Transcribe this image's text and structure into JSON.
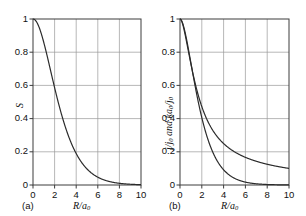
{
  "figure": {
    "background": "#ffffff",
    "grid_color": "#9a9a9a",
    "axis_color": "#3c3c3c",
    "curve_color": "#2b2b2b"
  },
  "panels": [
    {
      "tag": "(a)",
      "ylabel": "S",
      "xlabel_num": "R",
      "xlabel_den": "a",
      "xlabel_den_sub": "0",
      "yticks": [
        "0",
        "0.2",
        "0.4",
        "0.6",
        "0.8",
        "1"
      ],
      "xticks": [
        "0",
        "2",
        "4",
        "6",
        "8",
        "10"
      ]
    },
    {
      "tag": "(b)",
      "ylabel_parts": [
        "j",
        "/j",
        "0",
        " and ",
        "ka",
        "0",
        "/j",
        "0"
      ],
      "xlabel_num": "R",
      "xlabel_den": "a",
      "xlabel_den_sub": "0",
      "yticks": [
        "0",
        "0.2",
        "0.4",
        "0.6",
        "0.8",
        "1"
      ],
      "xticks": [
        "0",
        "2",
        "4",
        "6",
        "8",
        "10"
      ],
      "curve_labels": [
        "j",
        "k"
      ]
    }
  ],
  "chart_data": [
    {
      "type": "line",
      "title": "",
      "panel": "(a)",
      "xlabel": "R/a0",
      "ylabel": "S",
      "xlim": [
        0,
        10
      ],
      "ylim": [
        0,
        1
      ],
      "xticks": [
        0,
        2,
        4,
        6,
        8,
        10
      ],
      "yticks": [
        0,
        0.2,
        0.4,
        0.6,
        0.8,
        1
      ],
      "grid": true,
      "legend": "none",
      "series": [
        {
          "name": "S",
          "x": [
            0,
            0.25,
            0.5,
            0.75,
            1,
            1.25,
            1.5,
            1.75,
            2,
            2.25,
            2.5,
            2.75,
            3,
            3.5,
            4,
            4.5,
            5,
            5.5,
            6,
            6.5,
            7,
            7.5,
            8,
            8.5,
            9,
            9.5,
            10
          ],
          "y": [
            1.0,
            0.9754,
            0.9131,
            0.8279,
            0.7358,
            0.6461,
            0.5249,
            0.4711,
            0.5865,
            0.3485,
            0.2791,
            0.2311,
            0.1991,
            0.132,
            0.1893,
            0.0758,
            0.0493,
            0.0316,
            0.02,
            0.0125,
            0.0078,
            0.0048,
            0.0029,
            0.0018,
            0.0011,
            0.0006,
            0.0004
          ]
        }
      ],
      "formula": "S = exp(-R/a0) * (1 + R/a0 + (R/a0)^2/3)",
      "read_points": [
        {
          "x": 0,
          "y": 1.0
        },
        {
          "x": 2,
          "y": 0.586
        },
        {
          "x": 4,
          "y": 0.189
        },
        {
          "x": 6,
          "y": 0.047
        },
        {
          "x": 8,
          "y": 0.01
        },
        {
          "x": 10,
          "y": 0.002
        }
      ]
    },
    {
      "type": "line",
      "title": "",
      "panel": "(b)",
      "xlabel": "R/a0",
      "ylabel": "j/j0 and ka0/j0",
      "xlim": [
        0,
        10
      ],
      "ylim": [
        0,
        1
      ],
      "xticks": [
        0,
        2,
        4,
        6,
        8,
        10
      ],
      "yticks": [
        0,
        0.2,
        0.4,
        0.6,
        0.8,
        1
      ],
      "grid": true,
      "legend": "inline-labels",
      "series": [
        {
          "name": "j",
          "label_position": {
            "x": 4.6,
            "y": 0.27
          },
          "formula": "j/j0 = (a0/R) * (1 - (1 + R/a0) * exp(-2R/a0))",
          "read_points": [
            {
              "x": 0,
              "y": 1.0
            },
            {
              "x": 0.5,
              "y": 0.8
            },
            {
              "x": 1,
              "y": 0.64
            },
            {
              "x": 1.5,
              "y": 0.53
            },
            {
              "x": 2,
              "y": 0.455
            },
            {
              "x": 3,
              "y": 0.332
            },
            {
              "x": 4,
              "y": 0.25
            },
            {
              "x": 5,
              "y": 0.2
            },
            {
              "x": 6,
              "y": 0.167
            },
            {
              "x": 7,
              "y": 0.143
            },
            {
              "x": 8,
              "y": 0.125
            },
            {
              "x": 9,
              "y": 0.111
            },
            {
              "x": 10,
              "y": 0.1
            }
          ]
        },
        {
          "name": "k",
          "label_position": {
            "x": 4.1,
            "y": 0.115
          },
          "formula": "ka0/j0 = (1 + R/a0) * exp(-R/a0)",
          "read_points": [
            {
              "x": 0,
              "y": 1.0
            },
            {
              "x": 0.5,
              "y": 0.91
            },
            {
              "x": 1,
              "y": 0.736
            },
            {
              "x": 1.5,
              "y": 0.558
            },
            {
              "x": 2,
              "y": 0.406
            },
            {
              "x": 3,
              "y": 0.199
            },
            {
              "x": 4,
              "y": 0.092
            },
            {
              "x": 5,
              "y": 0.04
            },
            {
              "x": 6,
              "y": 0.017
            },
            {
              "x": 7,
              "y": 0.0073
            },
            {
              "x": 8,
              "y": 0.003
            },
            {
              "x": 9,
              "y": 0.0012
            },
            {
              "x": 10,
              "y": 0.0005
            }
          ]
        }
      ]
    }
  ]
}
